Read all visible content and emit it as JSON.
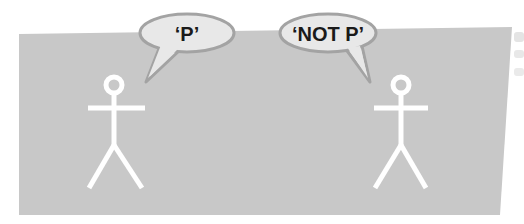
{
  "colors": {
    "background": "#ffffff",
    "panel": "#c8c8c8",
    "bubble_fill": "#e8e8e8",
    "bubble_stroke": "#a3a3a3",
    "figure": "#ffffff",
    "text": "#1a1a1a"
  },
  "speech_bubbles": [
    {
      "speaker": "left-figure",
      "text": "‘P’"
    },
    {
      "speaker": "right-figure",
      "text": "‘NOT P’"
    }
  ],
  "figures": [
    {
      "name": "left-stick-figure"
    },
    {
      "name": "right-stick-figure"
    }
  ]
}
